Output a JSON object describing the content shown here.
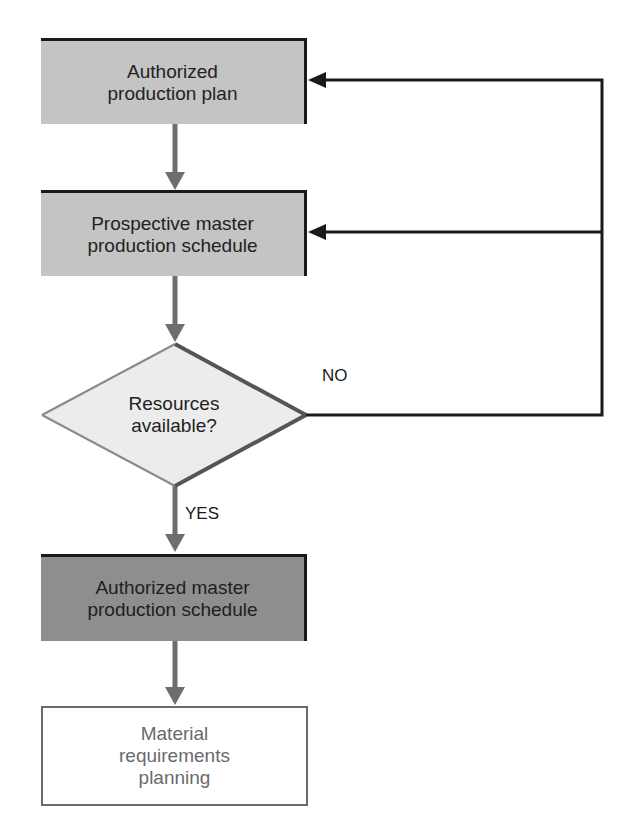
{
  "nodes": {
    "production_plan": {
      "label": "Authorized\nproduction plan",
      "fill": "#c4c4c4"
    },
    "prospective_mps": {
      "label": "Prospective master\nproduction schedule",
      "fill": "#c4c4c4"
    },
    "decision": {
      "label": "Resources\navailable?",
      "fill": "#ececec"
    },
    "authorized_mps": {
      "label": "Authorized master\nproduction schedule",
      "fill": "#8e8e8e"
    },
    "mrp": {
      "label": "Material\nrequirements\nplanning",
      "fill": "#ffffff"
    }
  },
  "edges": {
    "yes_label": "YES",
    "no_label": "NO"
  },
  "colors": {
    "arrow_grey": "#6e6e6e",
    "feedback_black": "#1a1a1a"
  }
}
